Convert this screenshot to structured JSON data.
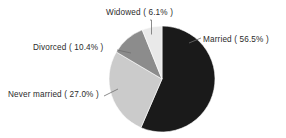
{
  "chart_data": {
    "type": "pie",
    "title": "",
    "subtitle": "",
    "xlabel": "",
    "ylabel": "",
    "legend_position": "none",
    "grid": false,
    "label_format": "{name} ( {value}% )",
    "start_angle_deg": 0,
    "direction": "clockwise",
    "categories": [
      "Married",
      "Never married",
      "Divorced",
      "Widowed"
    ],
    "values": [
      56.5,
      27.0,
      10.4,
      6.1
    ],
    "units": "percent",
    "colors": [
      "#1a1a1a",
      "#cbcbcb",
      "#8c8c8c",
      "#e9e9e9"
    ],
    "background": "#ffffff",
    "text_color": "#2b2b2b",
    "leader_line_color": "#6f6f6f",
    "slices": [
      {
        "name": "Married",
        "value": 56.5,
        "label": "Married ( 56.5% )",
        "color": "#1a1a1a",
        "start_deg": 0,
        "end_deg": 203.4
      },
      {
        "name": "Never married",
        "value": 27.0,
        "label": "Never married ( 27.0% )",
        "color": "#cbcbcb",
        "start_deg": 203.4,
        "end_deg": 300.6
      },
      {
        "name": "Divorced",
        "value": 10.4,
        "label": "Divorced ( 10.4% )",
        "color": "#8c8c8c",
        "start_deg": 300.6,
        "end_deg": 338.0
      },
      {
        "name": "Widowed",
        "value": 6.1,
        "label": "Widowed ( 6.1% )",
        "color": "#e9e9e9",
        "start_deg": 338.0,
        "end_deg": 360.0
      }
    ]
  },
  "labels": {
    "widowed": "Widowed ( 6.1% )",
    "married": "Married ( 56.5% )",
    "divorced": "Divorced ( 10.4% )",
    "never_married": "Never married ( 27.0% )"
  }
}
